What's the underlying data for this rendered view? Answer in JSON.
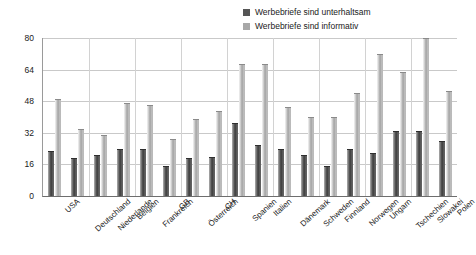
{
  "chart_data": {
    "type": "bar",
    "title": "",
    "subtitle": "",
    "xlabel": "",
    "ylabel": "",
    "ylim": [
      0,
      80
    ],
    "yticks": [
      0,
      16,
      32,
      48,
      64,
      80
    ],
    "grid": true,
    "legend_position": "top-right",
    "orientation": "vertical",
    "categories": [
      "USA",
      "Deutschland",
      "Niederlande",
      "Belgien",
      "Frankreich",
      "GB",
      "Österreich",
      "CH",
      "Spanien",
      "Italien",
      "Dänemark",
      "Schweden",
      "Finnland",
      "Norwegen",
      "Ungarn",
      "Tschechien",
      "Slowakei",
      "Polen"
    ],
    "series": [
      {
        "name": "Werbebriefe sind unterhaltsam",
        "color": "#555555",
        "values": [
          23,
          19,
          21,
          24,
          24,
          15,
          19,
          20,
          37,
          26,
          24,
          21,
          15,
          24,
          22,
          33,
          33,
          28
        ]
      },
      {
        "name": "Werbebriefe sind informativ",
        "color": "#a8a8a8",
        "values": [
          49,
          34,
          31,
          47,
          46,
          29,
          39,
          43,
          67,
          67,
          45,
          40,
          40,
          52,
          72,
          63,
          80,
          53
        ]
      }
    ]
  },
  "legend": {
    "entries": [
      {
        "label": "Werbebriefe sind unterhaltsam",
        "swatch": "dark-swatch-icon"
      },
      {
        "label": "Werbebriefe sind informativ",
        "swatch": "light-swatch-icon"
      }
    ]
  }
}
